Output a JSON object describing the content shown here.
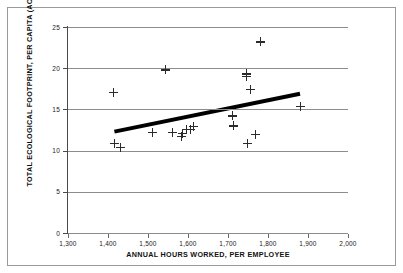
{
  "chart_data": {
    "type": "scatter",
    "title": "",
    "xlabel": "ANNUAL HOURS WORKED, PER EMPLOYEE",
    "ylabel": "TOTAL ECOLOGICAL FOOTPRINT, PER CAPITA (ACRES)",
    "xlim": [
      1300,
      2000
    ],
    "ylim": [
      0,
      25
    ],
    "xticks": [
      1300,
      1400,
      1500,
      1600,
      1700,
      1800,
      1900,
      2000
    ],
    "xtick_labels": [
      "1,300",
      "1,400",
      "1,500",
      "1,600",
      "1,700",
      "1,800",
      "1,900",
      "2,000"
    ],
    "yticks": [
      0,
      5,
      10,
      15,
      20,
      25
    ],
    "ytick_labels": [
      "0",
      "5",
      "10",
      "15",
      "20",
      "25"
    ],
    "grid": "horizontal",
    "legend": null,
    "marker": "plus",
    "marker_color": "#2b2b2b",
    "grid_color": "#8d8d8d",
    "points": [
      {
        "x": 1414,
        "y": 17.1
      },
      {
        "x": 1416,
        "y": 10.9
      },
      {
        "x": 1431,
        "y": 10.4
      },
      {
        "x": 1512,
        "y": 12.2
      },
      {
        "x": 1543,
        "y": 19.8
      },
      {
        "x": 1562,
        "y": 12.2
      },
      {
        "x": 1583,
        "y": 11.7
      },
      {
        "x": 1586,
        "y": 12.1
      },
      {
        "x": 1595,
        "y": 12.6
      },
      {
        "x": 1605,
        "y": 12.6
      },
      {
        "x": 1613,
        "y": 12.9
      },
      {
        "x": 1712,
        "y": 14.2
      },
      {
        "x": 1714,
        "y": 13.0
      },
      {
        "x": 1745,
        "y": 19.3
      },
      {
        "x": 1746,
        "y": 19.0
      },
      {
        "x": 1748,
        "y": 10.9
      },
      {
        "x": 1755,
        "y": 17.4
      },
      {
        "x": 1768,
        "y": 12.0
      },
      {
        "x": 1781,
        "y": 23.2
      },
      {
        "x": 1881,
        "y": 15.4
      }
    ],
    "trend_line": {
      "label": "linear-fit",
      "color": "#000000",
      "width_px": 4,
      "x_start": 1416,
      "y_start": 12.3,
      "x_end": 1880,
      "y_end": 16.9
    }
  },
  "figure": {
    "background_color": "#ffffff",
    "frame_color": "#9a9a9a",
    "axis_color": "#4a4a4a"
  }
}
